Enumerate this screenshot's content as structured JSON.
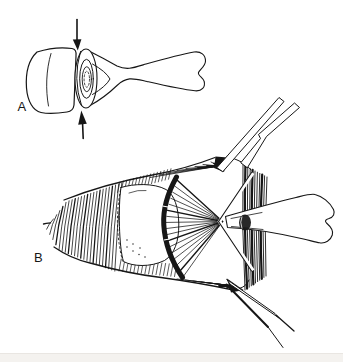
{
  "colors": {
    "ink": "#161616",
    "paper": "#ffffff",
    "paper_strip": "#f4f2ef",
    "paper_strip_edge": "#e9e6e2"
  },
  "panels": {
    "a": {
      "label": "A"
    },
    "b": {
      "label": "B"
    }
  },
  "icons": {
    "compression_arrow_top": "arrow-down-icon",
    "compression_arrow_bottom": "arrow-up-icon"
  }
}
